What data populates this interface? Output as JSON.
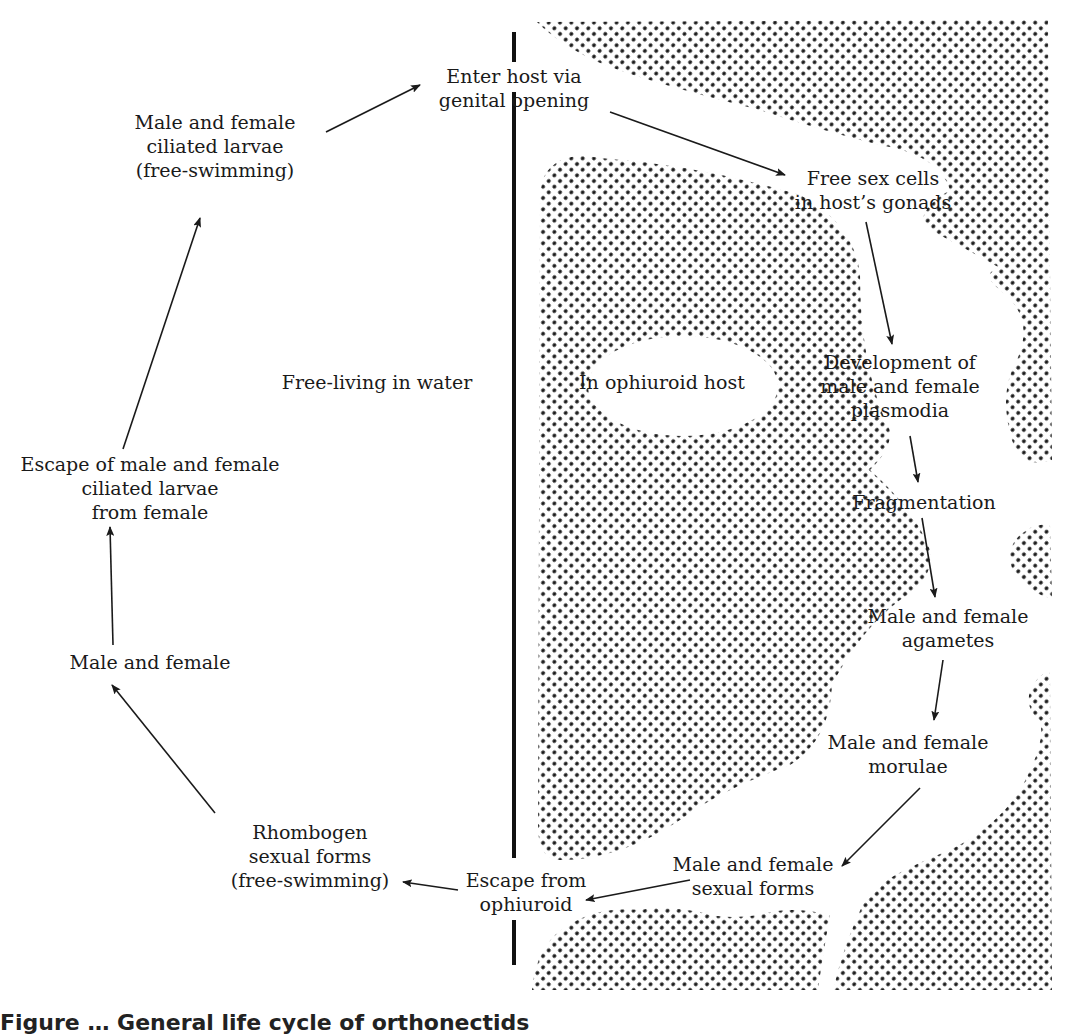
{
  "diagram": {
    "regions": {
      "outside": "Free-living in water",
      "inside": "In ophiuroid host"
    },
    "nodes": [
      {
        "id": "ciliated-larvae",
        "lines": [
          "Male and female",
          "ciliated larvae",
          "(free-swimming)"
        ]
      },
      {
        "id": "enter-host",
        "lines": [
          "Enter host via",
          "genital opening"
        ]
      },
      {
        "id": "free-sex-cells",
        "lines": [
          "Free sex cells",
          "in host’s gonads"
        ]
      },
      {
        "id": "plasmodia",
        "lines": [
          "Development of",
          "male and female",
          "plasmodia"
        ]
      },
      {
        "id": "fragmentation",
        "lines": [
          "Fragmentation"
        ]
      },
      {
        "id": "agametes",
        "lines": [
          "Male and female",
          "agametes"
        ]
      },
      {
        "id": "morulae",
        "lines": [
          "Male and female",
          "morulae"
        ]
      },
      {
        "id": "sexual-forms",
        "lines": [
          "Male and female",
          "sexual forms"
        ]
      },
      {
        "id": "escape-ophiuroid",
        "lines": [
          "Escape from",
          "ophiuroid"
        ]
      },
      {
        "id": "rhombogen",
        "lines": [
          "Rhombogen",
          "sexual forms",
          "(free-swimming)"
        ]
      },
      {
        "id": "male-female",
        "lines": [
          "Male and female"
        ]
      },
      {
        "id": "escape-larvae",
        "lines": [
          "Escape of male and female",
          "ciliated larvae",
          "from female"
        ]
      }
    ],
    "edges": [
      [
        "ciliated-larvae",
        "enter-host"
      ],
      [
        "enter-host",
        "free-sex-cells"
      ],
      [
        "free-sex-cells",
        "plasmodia"
      ],
      [
        "plasmodia",
        "fragmentation"
      ],
      [
        "fragmentation",
        "agametes"
      ],
      [
        "agametes",
        "morulae"
      ],
      [
        "morulae",
        "sexual-forms"
      ],
      [
        "sexual-forms",
        "escape-ophiuroid"
      ],
      [
        "escape-ophiuroid",
        "rhombogen"
      ],
      [
        "rhombogen",
        "male-female"
      ],
      [
        "male-female",
        "escape-larvae"
      ],
      [
        "escape-larvae",
        "ciliated-larvae"
      ]
    ],
    "caption_partial": "Figure … General life cycle of orthonectids"
  }
}
